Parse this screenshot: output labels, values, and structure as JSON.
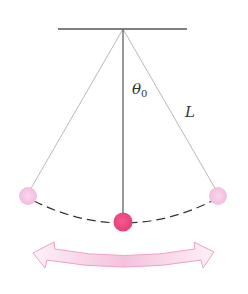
{
  "diagram": {
    "type": "simple pendulum",
    "labels": {
      "angle": "θ",
      "angle_subscript": "0",
      "length": "L"
    },
    "colors": {
      "line": "#444444",
      "bob_center": "#ef4a82",
      "bob_extreme": "#f6c6e3",
      "arrow_stroke": "#f1a3c8",
      "arrow_fill": "#f8d4e8"
    },
    "elements": {
      "support": "horizontal ceiling bar",
      "pivot": "top center",
      "bobs": [
        "left-extreme",
        "center",
        "right-extreme"
      ],
      "swing_path": "dashed arc",
      "motion_indicator": "double-headed curved arrow"
    }
  }
}
